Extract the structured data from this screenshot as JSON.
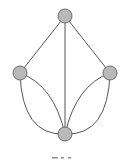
{
  "diagram": {
    "type": "graph",
    "nodes": [
      {
        "id": "top"
      },
      {
        "id": "left"
      },
      {
        "id": "right"
      },
      {
        "id": "bottom"
      }
    ],
    "edges": [
      {
        "from": "top",
        "to": "left",
        "shape": "straight"
      },
      {
        "from": "top",
        "to": "right",
        "shape": "straight"
      },
      {
        "from": "top",
        "to": "bottom",
        "shape": "straight"
      },
      {
        "from": "left",
        "to": "bottom",
        "shape": "curved-inner"
      },
      {
        "from": "left",
        "to": "bottom",
        "shape": "curved-outer"
      },
      {
        "from": "right",
        "to": "bottom",
        "shape": "curved-inner"
      },
      {
        "from": "right",
        "to": "bottom",
        "shape": "curved-outer"
      }
    ],
    "colors": {
      "node_fill": "#b9b9b9",
      "node_stroke": "#6a6a6a",
      "edge": "#555555"
    },
    "caption": {
      "cut_off": true
    }
  }
}
